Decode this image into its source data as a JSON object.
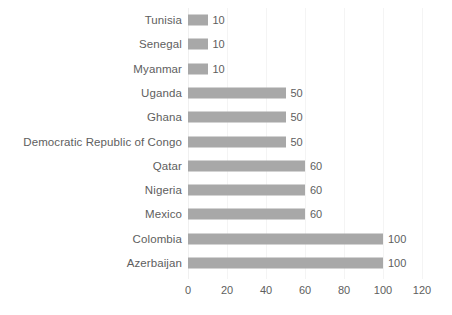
{
  "chart_data": {
    "type": "bar",
    "orientation": "horizontal",
    "title": "",
    "xlabel": "",
    "ylabel": "",
    "xlim": [
      0,
      120
    ],
    "xticks": [
      0,
      20,
      40,
      60,
      80,
      100,
      120
    ],
    "grid": true,
    "grid_axis": "x",
    "legend": false,
    "data_labels": true,
    "categories": [
      "Tunisia",
      "Senegal",
      "Myanmar",
      "Uganda",
      "Ghana",
      "Democratic Republic of Congo",
      "Qatar",
      "Nigeria",
      "Mexico",
      "Colombia",
      "Azerbaijan"
    ],
    "values": [
      10,
      10,
      10,
      50,
      50,
      50,
      60,
      60,
      60,
      100,
      100
    ],
    "value_labels": [
      "10",
      "10",
      "10",
      "50",
      "50",
      "50",
      "60",
      "60",
      "60",
      "100",
      "100"
    ],
    "tick_labels": [
      "0",
      "20",
      "40",
      "60",
      "80",
      "100",
      "120"
    ],
    "colors": {
      "bar": "#a8a8a8",
      "text": "#5e5e5e",
      "grid": "#f4f4f4",
      "background": "#ffffff"
    }
  }
}
